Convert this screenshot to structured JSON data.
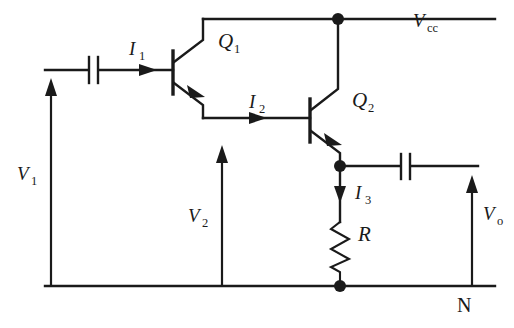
{
  "diagram": {
    "background_color": "#ffffff",
    "line_color": "#1a1a1a"
  },
  "labels": {
    "vcc": {
      "symbol": "V",
      "subscript": "cc",
      "name": "supply-rail-label"
    },
    "v1": {
      "symbol": "V",
      "subscript": "1",
      "name": "input-voltage-label"
    },
    "v2": {
      "symbol": "V",
      "subscript": "2",
      "name": "intermediate-voltage-label"
    },
    "vo": {
      "symbol": "V",
      "subscript": "o",
      "name": "output-voltage-label"
    },
    "i1": {
      "symbol": "I",
      "subscript": "1",
      "name": "base-current-label"
    },
    "i2": {
      "symbol": "I",
      "subscript": "2",
      "name": "coupling-current-label"
    },
    "i3": {
      "symbol": "I",
      "subscript": "3",
      "name": "emitter-current-label"
    },
    "q1": {
      "symbol": "Q",
      "subscript": "1",
      "name": "transistor-q1-label"
    },
    "q2": {
      "symbol": "Q",
      "subscript": "2",
      "name": "transistor-q2-label"
    },
    "r": {
      "symbol": "R",
      "subscript": "",
      "name": "resistor-label"
    },
    "n": {
      "symbol": "N",
      "subscript": "",
      "name": "ground-node-label"
    }
  },
  "components": {
    "transistors": [
      {
        "id": "Q1",
        "type": "npn",
        "label": "Q1"
      },
      {
        "id": "Q2",
        "type": "npn",
        "label": "Q2"
      }
    ],
    "capacitors": [
      {
        "id": "Cin",
        "position": "input"
      },
      {
        "id": "Cout",
        "position": "output"
      }
    ],
    "resistors": [
      {
        "id": "R",
        "label": "R"
      }
    ],
    "nodes": [
      {
        "id": "vcc-node",
        "x": 338,
        "y": 19
      },
      {
        "id": "emitter-node",
        "x": 340,
        "y": 166
      },
      {
        "id": "ground-node",
        "x": 340,
        "y": 286
      }
    ]
  },
  "currents": [
    {
      "id": "I1",
      "direction": "right",
      "label": "I1"
    },
    {
      "id": "I2",
      "direction": "right",
      "label": "I2"
    },
    {
      "id": "I3",
      "direction": "down",
      "label": "I3"
    }
  ],
  "voltages": [
    {
      "id": "V1",
      "direction": "up",
      "label": "V1"
    },
    {
      "id": "V2",
      "direction": "up",
      "label": "V2"
    },
    {
      "id": "Vo",
      "direction": "up",
      "label": "Vo"
    },
    {
      "id": "Vcc",
      "direction": "rail",
      "label": "Vcc"
    }
  ]
}
